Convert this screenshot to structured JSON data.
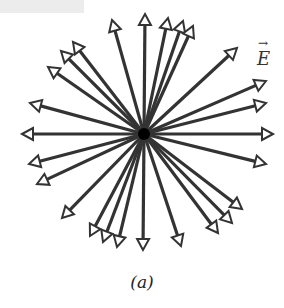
{
  "diagram": {
    "field_label": "E",
    "field_label_vector_mark": "→",
    "caption": "(a)",
    "center": [
      144,
      134
    ],
    "colors": {
      "arrow": "#333333",
      "charge": "#000000",
      "background": "#ffffff"
    },
    "arrow_tips": [
      [
        145,
        14
      ],
      [
        168,
        18
      ],
      [
        183,
        21
      ],
      [
        193,
        26
      ],
      [
        112,
        20
      ],
      [
        73,
        42
      ],
      [
        61,
        51
      ],
      [
        48,
        67
      ],
      [
        237,
        48
      ],
      [
        266,
        81
      ],
      [
        266,
        103
      ],
      [
        273,
        134
      ],
      [
        266,
        164
      ],
      [
        30,
        103
      ],
      [
        22,
        134
      ],
      [
        29,
        164
      ],
      [
        37,
        184
      ],
      [
        62,
        218
      ],
      [
        90,
        236
      ],
      [
        103,
        242
      ],
      [
        117,
        247
      ],
      [
        143,
        250
      ],
      [
        181,
        246
      ],
      [
        218,
        233
      ],
      [
        232,
        223
      ],
      [
        242,
        209
      ]
    ]
  }
}
